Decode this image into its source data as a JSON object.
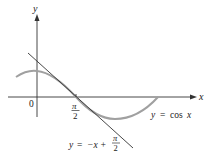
{
  "figure": {
    "type": "tangent-line-diagram",
    "axes": {
      "x_label": "x",
      "y_label": "y",
      "origin_label": "0"
    },
    "tick_label": {
      "numerator": "π",
      "denominator": "2"
    },
    "curve": {
      "label_y": "y",
      "label_eq": "=",
      "label_func": "cos",
      "label_var": "x",
      "color": "#a0a0a0"
    },
    "tangent": {
      "label_y": "y",
      "label_eq": "=",
      "label_rhs": "−x +",
      "frac_num": "π",
      "frac_den": "2",
      "color": "#333333"
    },
    "axis_color": "#333333"
  }
}
